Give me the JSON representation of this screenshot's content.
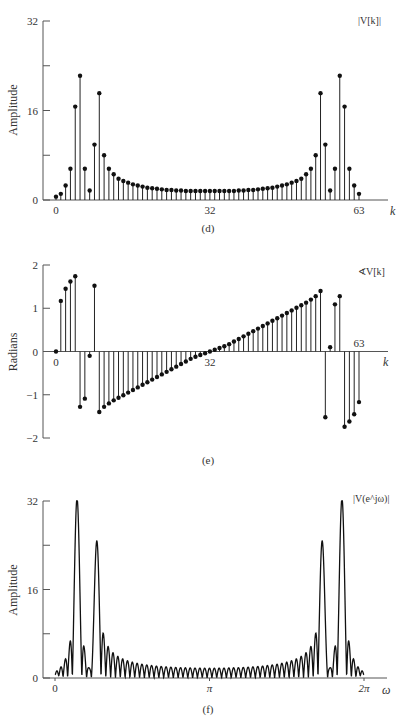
{
  "chart_data": [
    {
      "id": "d",
      "type": "stem",
      "caption": "(d)",
      "series_label": "|V[k]|",
      "ylabel": "Amplitude",
      "xlabel": "k",
      "ylim": [
        0,
        32
      ],
      "yticks": [
        0,
        8,
        16,
        24,
        32
      ],
      "ytick_labels": [
        "0",
        "",
        "16",
        "",
        "32"
      ],
      "xticks": [
        0,
        32,
        63
      ],
      "xtick_labels": [
        "0",
        "32",
        "63"
      ],
      "x": [
        0,
        1,
        2,
        3,
        4,
        5,
        6,
        7,
        8,
        9,
        10,
        11,
        12,
        13,
        14,
        15,
        16,
        17,
        18,
        19,
        20,
        21,
        22,
        23,
        24,
        25,
        26,
        27,
        28,
        29,
        30,
        31,
        32,
        33,
        34,
        35,
        36,
        37,
        38,
        39,
        40,
        41,
        42,
        43,
        44,
        45,
        46,
        47,
        48,
        49,
        50,
        51,
        52,
        53,
        54,
        55,
        56,
        57,
        58,
        59,
        60,
        61,
        62,
        63
      ],
      "values": [
        0.6,
        1.1,
        2.6,
        5.6,
        16.7,
        22.2,
        5.6,
        1.7,
        9.9,
        19.1,
        8.0,
        5.6,
        4.6,
        3.8,
        3.4,
        3.1,
        2.8,
        2.6,
        2.4,
        2.2,
        2.1,
        2.0,
        1.9,
        1.8,
        1.8,
        1.7,
        1.7,
        1.6,
        1.6,
        1.6,
        1.6,
        1.6,
        1.6,
        1.6,
        1.6,
        1.6,
        1.6,
        1.6,
        1.7,
        1.7,
        1.8,
        1.8,
        1.9,
        2.0,
        2.1,
        2.2,
        2.4,
        2.6,
        2.8,
        3.1,
        3.4,
        3.8,
        4.6,
        5.6,
        8.0,
        19.1,
        9.9,
        1.7,
        5.6,
        22.2,
        16.7,
        5.6,
        2.6,
        1.1
      ]
    },
    {
      "id": "e",
      "type": "stem",
      "caption": "(e)",
      "series_label": "∢V[k]",
      "ylabel": "Radians",
      "xlabel": "k",
      "ylim": [
        -2,
        2
      ],
      "yticks": [
        -2,
        -1,
        0,
        1,
        2
      ],
      "ytick_labels": [
        "−2",
        "−1",
        "0",
        "1",
        "2"
      ],
      "xticks": [
        0,
        32,
        63
      ],
      "xtick_labels": [
        "0",
        "32",
        "63"
      ],
      "x": [
        0,
        1,
        2,
        3,
        4,
        5,
        6,
        7,
        8,
        9,
        10,
        11,
        12,
        13,
        14,
        15,
        16,
        17,
        18,
        19,
        20,
        21,
        22,
        23,
        24,
        25,
        26,
        27,
        28,
        29,
        30,
        31,
        32,
        33,
        34,
        35,
        36,
        37,
        38,
        39,
        40,
        41,
        42,
        43,
        44,
        45,
        46,
        47,
        48,
        49,
        50,
        51,
        52,
        53,
        54,
        55,
        56,
        57,
        58,
        59,
        60,
        61,
        62,
        63
      ],
      "values": [
        0,
        1.17,
        1.45,
        1.62,
        1.74,
        -1.28,
        -1.09,
        -0.1,
        1.52,
        -1.4,
        -1.28,
        -1.2,
        -1.13,
        -1.07,
        -1.01,
        -0.95,
        -0.89,
        -0.83,
        -0.77,
        -0.71,
        -0.65,
        -0.59,
        -0.53,
        -0.47,
        -0.41,
        -0.35,
        -0.29,
        -0.23,
        -0.17,
        -0.12,
        -0.08,
        -0.04,
        0,
        0.04,
        0.08,
        0.12,
        0.17,
        0.23,
        0.29,
        0.35,
        0.41,
        0.47,
        0.53,
        0.59,
        0.65,
        0.71,
        0.77,
        0.83,
        0.89,
        0.95,
        1.01,
        1.07,
        1.13,
        1.2,
        1.28,
        1.4,
        -1.52,
        0.1,
        1.09,
        1.28,
        -1.74,
        -1.62,
        -1.45,
        -1.17
      ]
    },
    {
      "id": "f",
      "type": "line",
      "caption": "(f)",
      "series_label": "|V(e^jω)|",
      "ylabel": "Amplitude",
      "xlabel": "ω",
      "ylim": [
        0,
        32
      ],
      "xlim": [
        0,
        6.2832
      ],
      "yticks": [
        0,
        8,
        16,
        24,
        32
      ],
      "ytick_labels": [
        "0",
        "",
        "16",
        "",
        "32"
      ],
      "xticks": [
        0,
        3.1416,
        6.2832
      ],
      "xtick_labels": [
        "0",
        "π",
        "2π"
      ],
      "model": {
        "description": "DTFT magnitude of 64-point rectangular-windowed two-sinusoid signal",
        "N": 64,
        "components": [
          {
            "amplitude": 1.0,
            "omega": 0.4488
          },
          {
            "amplitude": 0.75,
            "omega": 0.8378
          }
        ]
      },
      "peaks": [
        {
          "omega": 0.45,
          "value": 31.5
        },
        {
          "omega": 0.84,
          "value": 24.0
        },
        {
          "omega": 5.44,
          "value": 24.0
        },
        {
          "omega": 5.83,
          "value": 31.5
        }
      ]
    }
  ]
}
